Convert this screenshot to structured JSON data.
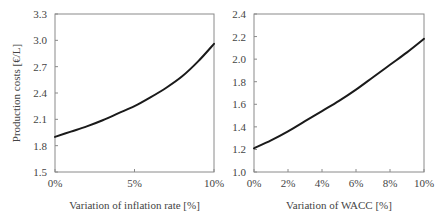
{
  "chart_data": [
    {
      "type": "line",
      "title": "",
      "xlabel": "Variation of inflation rate [%]",
      "ylabel": "Production costs [€/L]",
      "xlim": [
        0,
        10
      ],
      "ylim": [
        1.5,
        3.3
      ],
      "xticks": [
        0,
        5,
        10
      ],
      "xtick_labels": [
        "0%",
        "5%",
        "10%"
      ],
      "yticks": [
        1.5,
        1.8,
        2.1,
        2.4,
        2.7,
        3.0,
        3.3
      ],
      "ytick_labels": [
        "1.5",
        "1.8",
        "2.1",
        "2.4",
        "2.7",
        "3.0",
        "3.3"
      ],
      "grid": false,
      "legend": null,
      "series": [
        {
          "name": "Production costs",
          "x": [
            0,
            1,
            2,
            3,
            4,
            5,
            6,
            7,
            8,
            9,
            10
          ],
          "values": [
            1.9,
            1.96,
            2.02,
            2.09,
            2.17,
            2.25,
            2.35,
            2.46,
            2.59,
            2.76,
            2.96
          ]
        }
      ]
    },
    {
      "type": "line",
      "title": "",
      "xlabel": "Variation of WACC [%]",
      "ylabel": "",
      "xlim": [
        0,
        10
      ],
      "ylim": [
        1.0,
        2.4
      ],
      "xticks": [
        0,
        2,
        4,
        6,
        8,
        10
      ],
      "xtick_labels": [
        "0%",
        "2%",
        "4%",
        "6%",
        "8%",
        "10%"
      ],
      "yticks": [
        1.0,
        1.2,
        1.4,
        1.6,
        1.8,
        2.0,
        2.2,
        2.4
      ],
      "ytick_labels": [
        "1.0",
        "1.2",
        "1.4",
        "1.6",
        "1.8",
        "2.0",
        "2.2",
        "2.4"
      ],
      "grid": false,
      "legend": null,
      "series": [
        {
          "name": "Production costs",
          "x": [
            0,
            1,
            2,
            3,
            4,
            5,
            6,
            7,
            8,
            9,
            10
          ],
          "values": [
            1.21,
            1.28,
            1.36,
            1.45,
            1.54,
            1.63,
            1.73,
            1.84,
            1.95,
            2.06,
            2.18
          ]
        }
      ]
    }
  ],
  "panels": [
    {
      "xlabel": "Variation of inflation rate [%]",
      "ylabel": "Production costs [€/L]"
    },
    {
      "xlabel": "Variation of WACC [%]",
      "ylabel": ""
    }
  ],
  "colors": {
    "line": "#1a1a1a",
    "frame": "#8a8a8a",
    "text": "#444444"
  }
}
